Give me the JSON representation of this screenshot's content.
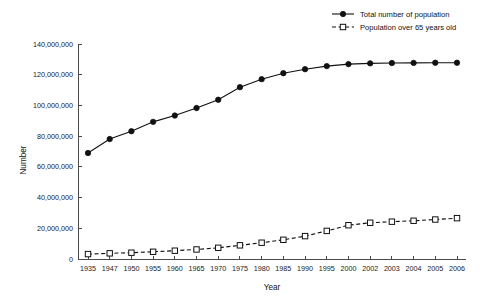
{
  "chart_data": {
    "type": "line",
    "title": "",
    "xlabel": "Year",
    "ylabel": "Number",
    "categories": [
      "1935",
      "1947",
      "1950",
      "1955",
      "1960",
      "1965",
      "1970",
      "1975",
      "1980",
      "1985",
      "1990",
      "1995",
      "2000",
      "2002",
      "2003",
      "2004",
      "2005",
      "2006"
    ],
    "ylim": [
      0,
      140000000
    ],
    "ytick_values": [
      0,
      20000000,
      40000000,
      60000000,
      80000000,
      100000000,
      120000000,
      140000000
    ],
    "ytick_labels": [
      "0",
      "20,000,000",
      "40,000,000",
      "60,000,000",
      "80,000,000",
      "100,000,000",
      "120,000,000",
      "140,000,000"
    ],
    "grid": false,
    "legend_position": "top-right",
    "series": [
      {
        "name": "Total number of population",
        "marker": "filled-circle",
        "line_style": "solid",
        "color": "#111111",
        "values": [
          69000000,
          78100000,
          83200000,
          89300000,
          93400000,
          98300000,
          103700000,
          111900000,
          117100000,
          121000000,
          123600000,
          125600000,
          126900000,
          127400000,
          127600000,
          127700000,
          127800000,
          127800000
        ]
      },
      {
        "name": "Population over 65 years old",
        "marker": "open-square",
        "line_style": "dashed",
        "color": "#111111",
        "values": [
          3200000,
          3700000,
          4100000,
          4700000,
          5400000,
          6200000,
          7300000,
          8900000,
          10600000,
          12500000,
          14900000,
          18300000,
          22000000,
          23600000,
          24300000,
          24900000,
          25700000,
          26600000
        ]
      }
    ]
  },
  "legend": {
    "items": [
      {
        "label": "Total number of population",
        "marker": "filled-circle",
        "line_style": "solid"
      },
      {
        "label": "Population over 65 years old",
        "marker": "open-square",
        "line_style": "dashed"
      }
    ]
  },
  "axes": {
    "x_title": "Year",
    "y_title": "Number"
  }
}
